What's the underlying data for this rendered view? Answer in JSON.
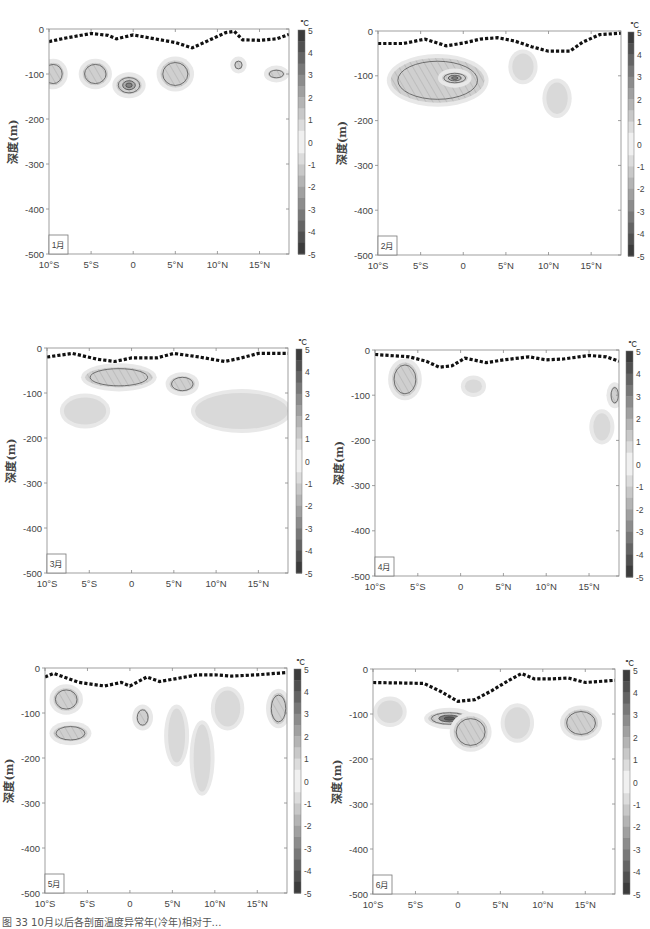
{
  "figure": {
    "caption": "图 33  10月以后各剖面温度异常年(冷年)相对于…",
    "unit": "℃",
    "ylabel": "深度(m)",
    "colorbar_ticks": [
      "5",
      "4",
      "3",
      "2",
      "1",
      "0",
      "-1",
      "-2",
      "-3",
      "-4",
      "-5"
    ]
  },
  "chart_data": [
    {
      "type": "heatmap",
      "title": "1月",
      "xlabel": "",
      "ylabel": "深度(m)",
      "x_ticks": [
        "10°S",
        "5°S",
        "0",
        "5°N",
        "10°N",
        "15°N"
      ],
      "x_tick_values": [
        -10,
        -5,
        0,
        5,
        10,
        15
      ],
      "xlim": [
        -10,
        18.5
      ],
      "y_ticks": [
        "0",
        "-100",
        "-200",
        "-300",
        "-400",
        "-500"
      ],
      "ylim": [
        -500,
        0
      ],
      "colorbar": {
        "label": "℃",
        "range": [
          -5,
          5
        ],
        "ticks": [
          5,
          4,
          3,
          2,
          1,
          0,
          -1,
          -2,
          -3,
          -4,
          -5
        ]
      },
      "mixed_layer_depth": {
        "x": [
          -10,
          -8,
          -5,
          -3,
          -2,
          0,
          2,
          5,
          7,
          9,
          11,
          12,
          13,
          15,
          17,
          18.5
        ],
        "y": [
          -28,
          -20,
          -10,
          -14,
          -22,
          -13,
          -20,
          -30,
          -42,
          -25,
          -8,
          -5,
          -24,
          -25,
          -22,
          -12
        ]
      },
      "anomaly_regions": [
        {
          "lon": -9.5,
          "depth": -100,
          "value": -1,
          "w": 2.5,
          "h": 50
        },
        {
          "lon": -4.5,
          "depth": -100,
          "value": -1,
          "w": 3,
          "h": 50
        },
        {
          "lon": -0.5,
          "depth": -125,
          "value": -2,
          "w": 3,
          "h": 40
        },
        {
          "lon": 5,
          "depth": -100,
          "value": -1,
          "w": 3.5,
          "h": 60
        },
        {
          "lon": 12.5,
          "depth": -80,
          "value": -1,
          "w": 1,
          "h": 20
        },
        {
          "lon": 17,
          "depth": -100,
          "value": -1,
          "w": 2,
          "h": 20
        }
      ]
    },
    {
      "type": "heatmap",
      "title": "2月",
      "x_ticks": [
        "10°S",
        "5°S",
        "0",
        "5°N",
        "10°N",
        "15°N"
      ],
      "x_tick_values": [
        -10,
        -5,
        0,
        5,
        10,
        15
      ],
      "xlim": [
        -10,
        18.5
      ],
      "y_ticks": [
        "0",
        "-100",
        "-200",
        "-300",
        "-400",
        "-500"
      ],
      "ylim": [
        -500,
        0
      ],
      "colorbar": {
        "label": "℃",
        "range": [
          -5,
          5
        ],
        "ticks": [
          5,
          4,
          3,
          2,
          1,
          0,
          -1,
          -2,
          -3,
          -4,
          -5
        ]
      },
      "mixed_layer_depth": {
        "x": [
          -10,
          -7,
          -4.5,
          -2,
          0,
          2,
          4,
          6,
          8,
          10,
          12.5,
          14,
          16,
          18.5
        ],
        "y": [
          -28,
          -28,
          -18,
          -33,
          -27,
          -18,
          -15,
          -22,
          -35,
          -45,
          -45,
          -25,
          -8,
          -5
        ]
      },
      "anomaly_regions": [
        {
          "lon": -3,
          "depth": -110,
          "value": -1,
          "w": 11,
          "h": 100
        },
        {
          "lon": -1,
          "depth": -105,
          "value": -2,
          "w": 3,
          "h": 25
        },
        {
          "lon": 7,
          "depth": -80,
          "value": -0.5,
          "w": 2.5,
          "h": 60
        },
        {
          "lon": 11,
          "depth": -150,
          "value": -0.5,
          "w": 2.5,
          "h": 70
        }
      ]
    },
    {
      "type": "heatmap",
      "title": "3月",
      "x_ticks": [
        "10°S",
        "5°S",
        "0",
        "5°N",
        "10°N",
        "15°N"
      ],
      "x_tick_values": [
        -10,
        -5,
        0,
        5,
        10,
        15
      ],
      "xlim": [
        -10,
        18.5
      ],
      "y_ticks": [
        "0",
        "-100",
        "-200",
        "-300",
        "-400",
        "-500"
      ],
      "ylim": [
        -500,
        0
      ],
      "colorbar": {
        "label": "℃",
        "range": [
          -5,
          5
        ],
        "ticks": [
          5,
          4,
          3,
          2,
          1,
          0,
          -1,
          -2,
          -3,
          -4,
          -5
        ]
      },
      "mixed_layer_depth": {
        "x": [
          -10,
          -7,
          -4,
          -2,
          0,
          3,
          5,
          8,
          11,
          13,
          15,
          18.5
        ],
        "y": [
          -20,
          -12,
          -25,
          -30,
          -22,
          -22,
          -12,
          -20,
          -30,
          -22,
          -12,
          -12
        ]
      },
      "anomaly_regions": [
        {
          "lon": -1.5,
          "depth": -65,
          "value": -1,
          "w": 8,
          "h": 45
        },
        {
          "lon": -5.5,
          "depth": -140,
          "value": -0.5,
          "w": 5,
          "h": 60
        },
        {
          "lon": 6,
          "depth": -80,
          "value": -1,
          "w": 3,
          "h": 35
        },
        {
          "lon": 13,
          "depth": -140,
          "value": -0.5,
          "w": 11,
          "h": 80
        }
      ]
    },
    {
      "type": "heatmap",
      "title": "4月",
      "x_ticks": [
        "10°S",
        "5°S",
        "0",
        "5°N",
        "10°N",
        "15°N"
      ],
      "x_tick_values": [
        -10,
        -5,
        0,
        5,
        10,
        15
      ],
      "xlim": [
        -10,
        18.5
      ],
      "y_ticks": [
        "0",
        "-100",
        "-200",
        "-300",
        "-400",
        "-500"
      ],
      "ylim": [
        -500,
        0
      ],
      "colorbar": {
        "label": "℃",
        "range": [
          -5,
          5
        ],
        "ticks": [
          5,
          4,
          3,
          2,
          1,
          0,
          -1,
          -2,
          -3,
          -4,
          -5
        ]
      },
      "mixed_layer_depth": {
        "x": [
          -10,
          -6,
          -4,
          -2.5,
          -1,
          0.5,
          3,
          5,
          8,
          10,
          12,
          15,
          17,
          18.5
        ],
        "y": [
          -10,
          -15,
          -25,
          -38,
          -35,
          -18,
          -28,
          -22,
          -15,
          -22,
          -20,
          -12,
          -15,
          -25
        ]
      },
      "anomaly_regions": [
        {
          "lon": -6.5,
          "depth": -65,
          "value": -1,
          "w": 3,
          "h": 75
        },
        {
          "lon": 1.5,
          "depth": -80,
          "value": -0.5,
          "w": 2,
          "h": 30
        },
        {
          "lon": 16.5,
          "depth": -170,
          "value": -0.5,
          "w": 2,
          "h": 60
        },
        {
          "lon": 18,
          "depth": -100,
          "value": -1,
          "w": 1,
          "h": 40
        }
      ]
    },
    {
      "type": "heatmap",
      "title": "5月",
      "x_ticks": [
        "10°S",
        "5°S",
        "0",
        "5°N",
        "10°N",
        "15°N"
      ],
      "x_tick_values": [
        -10,
        -5,
        0,
        5,
        10,
        15
      ],
      "xlim": [
        -10,
        18.5
      ],
      "y_ticks": [
        "0",
        "-100",
        "-200",
        "-300",
        "-400",
        "-500"
      ],
      "ylim": [
        -500,
        0
      ],
      "colorbar": {
        "label": "℃",
        "range": [
          -5,
          5
        ],
        "ticks": [
          5,
          4,
          3,
          2,
          1,
          0,
          -1,
          -2,
          -3,
          -4,
          -5
        ]
      },
      "mixed_layer_depth": {
        "x": [
          -10,
          -9,
          -6,
          -3,
          -1,
          0,
          2,
          3.5,
          5,
          8,
          10,
          12,
          15,
          18.5
        ],
        "y": [
          -20,
          -12,
          -32,
          -40,
          -32,
          -40,
          -20,
          -30,
          -25,
          -15,
          -15,
          -18,
          -15,
          -10
        ]
      },
      "anomaly_regions": [
        {
          "lon": -7.5,
          "depth": -70,
          "value": -1,
          "w": 3,
          "h": 50
        },
        {
          "lon": -7,
          "depth": -145,
          "value": -1,
          "w": 4,
          "h": 35
        },
        {
          "lon": 1.5,
          "depth": -110,
          "value": -1,
          "w": 1.5,
          "h": 40
        },
        {
          "lon": 5.5,
          "depth": -150,
          "value": -0.5,
          "w": 2,
          "h": 120
        },
        {
          "lon": 8.5,
          "depth": -200,
          "value": -0.5,
          "w": 2,
          "h": 150
        },
        {
          "lon": 11.5,
          "depth": -90,
          "value": -0.5,
          "w": 3,
          "h": 80
        },
        {
          "lon": 17.5,
          "depth": -90,
          "value": -1,
          "w": 2,
          "h": 70
        }
      ]
    },
    {
      "type": "heatmap",
      "title": "6月",
      "x_ticks": [
        "10°S",
        "5°S",
        "0",
        "5°N",
        "10°N",
        "15°N"
      ],
      "x_tick_values": [
        -10,
        -5,
        0,
        5,
        10,
        15
      ],
      "xlim": [
        -10,
        18.5
      ],
      "y_ticks": [
        "0",
        "-100",
        "-200",
        "-300",
        "-400",
        "-500"
      ],
      "ylim": [
        -500,
        0
      ],
      "colorbar": {
        "label": "℃",
        "range": [
          -5,
          5
        ],
        "ticks": [
          5,
          4,
          3,
          2,
          1,
          0,
          -1,
          -2,
          -3,
          -4,
          -5
        ]
      },
      "mixed_layer_depth": {
        "x": [
          -10,
          -4,
          -2,
          0,
          2,
          4,
          6,
          7.5,
          9,
          11,
          13,
          15,
          18.5
        ],
        "y": [
          -30,
          -32,
          -50,
          -72,
          -68,
          -48,
          -25,
          -10,
          -22,
          -22,
          -20,
          -30,
          -25
        ]
      },
      "anomaly_regions": [
        {
          "lon": -8,
          "depth": -95,
          "value": -0.5,
          "w": 3,
          "h": 50
        },
        {
          "lon": -1,
          "depth": -110,
          "value": -3,
          "w": 5,
          "h": 30
        },
        {
          "lon": 1.5,
          "depth": -140,
          "value": -1,
          "w": 4,
          "h": 70
        },
        {
          "lon": 7,
          "depth": -120,
          "value": -0.5,
          "w": 3,
          "h": 70
        },
        {
          "lon": 14.5,
          "depth": -120,
          "value": -1,
          "w": 4,
          "h": 60
        }
      ]
    }
  ]
}
